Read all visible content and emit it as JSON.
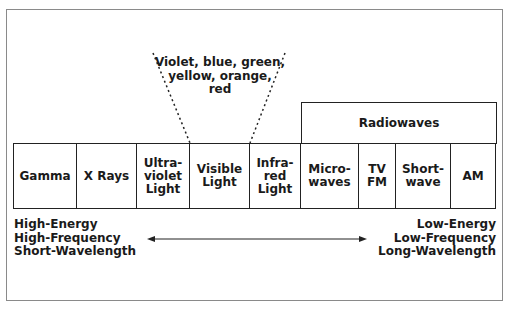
{
  "diagram": {
    "visible_breakout": {
      "lines": [
        "Violet, blue, green,",
        "yellow, orange,",
        "red"
      ]
    },
    "group_label": "Radiowaves",
    "bands": [
      {
        "lines": [
          "Gamma"
        ]
      },
      {
        "lines": [
          "X Rays"
        ]
      },
      {
        "lines": [
          "Ultra-",
          "violet",
          "Light"
        ]
      },
      {
        "lines": [
          "Visible",
          "Light"
        ]
      },
      {
        "lines": [
          "Infra-",
          "red",
          "Light"
        ]
      },
      {
        "lines": [
          "Micro-",
          "waves"
        ]
      },
      {
        "lines": [
          "TV",
          "FM"
        ]
      },
      {
        "lines": [
          "Short-",
          "wave"
        ]
      },
      {
        "lines": [
          "AM"
        ]
      }
    ],
    "left_end": {
      "lines": [
        "High-Energy",
        "High-Frequency",
        "Short-Wavelength"
      ]
    },
    "right_end": {
      "lines": [
        "Low-Energy",
        "Low-Frequency",
        "Long-Wavelength"
      ]
    },
    "arrow": "double-headed-arrow"
  }
}
